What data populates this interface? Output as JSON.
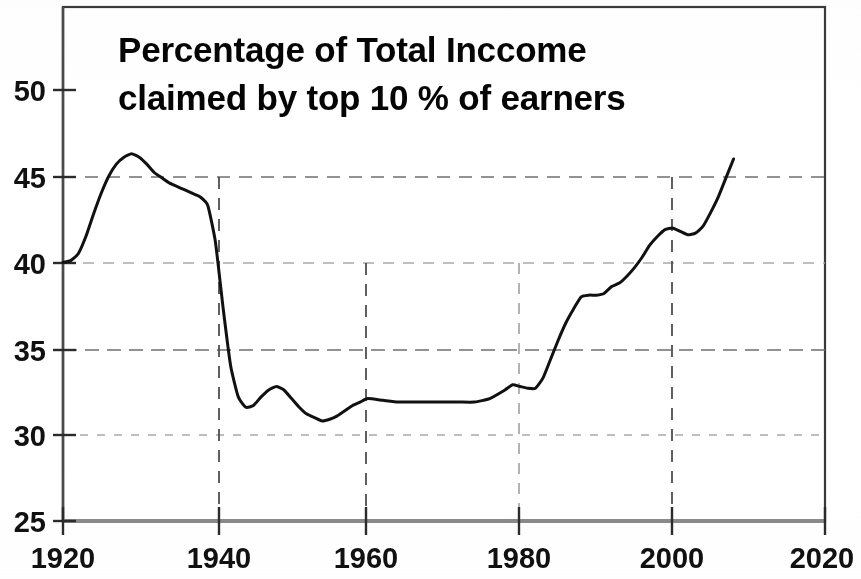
{
  "chart_data": {
    "type": "line",
    "title": "Percentage of Total Inccome claimed by top 10 % of earners",
    "title_line1": "Percentage of Total Inccome",
    "title_line2": "claimed by top 10 % of earners",
    "xlabel": "",
    "ylabel": "",
    "xlim": [
      1920,
      2020
    ],
    "ylim": [
      25,
      52
    ],
    "grid": true,
    "legend": "none",
    "x_ticks": [
      "1920",
      "1940",
      "1960",
      "1980",
      "2000",
      "2020"
    ],
    "x_tick_values": [
      1920,
      1940,
      1960,
      1980,
      2000,
      2020
    ],
    "y_ticks": [
      "25",
      "30",
      "35",
      "40",
      "45",
      "50"
    ],
    "y_tick_values": [
      25,
      30,
      35,
      40,
      45,
      50
    ],
    "series": [
      {
        "name": "Top 10% income share",
        "x": [
          1920,
          1921,
          1922,
          1923,
          1924,
          1925,
          1926,
          1927,
          1928,
          1929,
          1930,
          1931,
          1932,
          1933,
          1934,
          1935,
          1936,
          1937,
          1938,
          1939,
          1940,
          1941,
          1942,
          1943,
          1944,
          1945,
          1946,
          1947,
          1948,
          1949,
          1950,
          1951,
          1952,
          1953,
          1954,
          1955,
          1956,
          1957,
          1958,
          1959,
          1960,
          1962,
          1964,
          1966,
          1968,
          1970,
          1972,
          1974,
          1976,
          1978,
          1979,
          1980,
          1981,
          1982,
          1983,
          1984,
          1985,
          1986,
          1987,
          1988,
          1989,
          1990,
          1991,
          1992,
          1993,
          1994,
          1995,
          1996,
          1997,
          1998,
          1999,
          2000,
          2001,
          2002,
          2003,
          2004,
          2005,
          2006,
          2007,
          2008
        ],
        "y": [
          40.0,
          40.1,
          40.5,
          41.5,
          42.8,
          44.0,
          45.0,
          45.7,
          46.1,
          46.3,
          46.1,
          45.7,
          45.2,
          44.9,
          44.6,
          44.4,
          44.2,
          44.0,
          43.8,
          43.3,
          41.2,
          37.4,
          34.0,
          32.2,
          31.6,
          31.7,
          32.2,
          32.6,
          32.8,
          32.6,
          32.1,
          31.6,
          31.2,
          31.0,
          30.8,
          30.9,
          31.1,
          31.4,
          31.7,
          31.9,
          32.1,
          32.0,
          31.9,
          31.9,
          31.9,
          31.9,
          31.9,
          31.9,
          32.1,
          32.6,
          32.9,
          32.8,
          32.7,
          32.7,
          33.3,
          34.4,
          35.5,
          36.5,
          37.3,
          38.0,
          38.1,
          38.1,
          38.2,
          38.6,
          38.8,
          39.2,
          39.7,
          40.3,
          41.0,
          41.5,
          41.9,
          42.0,
          41.8,
          41.6,
          41.7,
          42.1,
          42.9,
          43.8,
          44.9,
          46.0
        ]
      }
    ],
    "annotations": []
  },
  "axis": {
    "y_title": "",
    "x_title": ""
  }
}
